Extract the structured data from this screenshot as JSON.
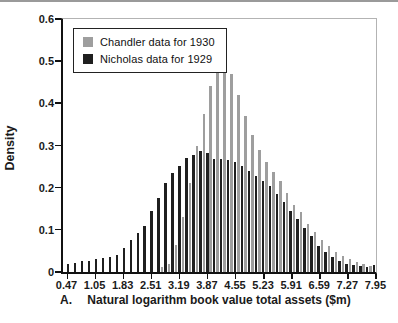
{
  "legend": {
    "items": [
      {
        "label": "Chandler data for 1930",
        "color": "#9e9e9e"
      },
      {
        "label": "Nicholas data for 1929",
        "color": "#1f1f1f"
      }
    ]
  },
  "axes": {
    "ylabel": "Density",
    "xlabel": "Natural logarithm book value total assets ($m)",
    "panel_label": "A.",
    "ytick_labels": [
      "0",
      "0.1",
      "0.2",
      "0.3",
      "0.4",
      "0.5",
      "0.6"
    ],
    "xtick_labels": [
      "0.47",
      "1.05",
      "1.83",
      "2.51",
      "3.19",
      "3.87",
      "4.55",
      "5.23",
      "5.91",
      "6.59",
      "7.27",
      "7.95"
    ]
  },
  "chart_data": {
    "type": "bar",
    "subtype": "histogram-interleaved",
    "title": "",
    "xlabel": "Natural logarithm book value total assets ($m)",
    "ylabel": "Density",
    "ylim": [
      0,
      0.6
    ],
    "xlim": [
      0.47,
      7.95
    ],
    "grid": false,
    "legend_position": "top-left",
    "x": [
      0.47,
      0.64,
      0.81,
      0.98,
      1.15,
      1.32,
      1.49,
      1.66,
      1.83,
      2.0,
      2.17,
      2.34,
      2.51,
      2.68,
      2.85,
      3.02,
      3.19,
      3.36,
      3.53,
      3.7,
      3.87,
      4.04,
      4.21,
      4.38,
      4.55,
      4.72,
      4.89,
      5.06,
      5.23,
      5.4,
      5.57,
      5.74,
      5.91,
      6.08,
      6.25,
      6.42,
      6.59,
      6.76,
      6.93,
      7.1,
      7.27,
      7.44,
      7.61,
      7.78,
      7.95
    ],
    "series": [
      {
        "name": "Chandler data for 1930",
        "color": "#9e9e9e",
        "values": [
          0,
          0,
          0,
          0,
          0,
          0,
          0,
          0,
          0,
          0,
          0,
          0,
          0,
          0,
          0.012,
          0.018,
          0.065,
          0.13,
          0.21,
          0.3,
          0.375,
          0.44,
          0.48,
          0.49,
          0.47,
          0.42,
          0.37,
          0.325,
          0.29,
          0.262,
          0.238,
          0.215,
          0.188,
          0.16,
          0.142,
          0.115,
          0.095,
          0.075,
          0.062,
          0.048,
          0.038,
          0.03,
          0.024,
          0.02,
          0.015
        ]
      },
      {
        "name": "Nicholas data for 1929",
        "color": "#1f1f1f",
        "values": [
          0.02,
          0.022,
          0.025,
          0.027,
          0.03,
          0.033,
          0.036,
          0.04,
          0.058,
          0.075,
          0.092,
          0.11,
          0.145,
          0.175,
          0.21,
          0.235,
          0.252,
          0.27,
          0.278,
          0.288,
          0.283,
          0.268,
          0.267,
          0.266,
          0.26,
          0.252,
          0.24,
          0.227,
          0.215,
          0.205,
          0.185,
          0.165,
          0.145,
          0.125,
          0.105,
          0.085,
          0.062,
          0.048,
          0.035,
          0.025,
          0.02,
          0.016,
          0.014,
          0.012,
          0.016
        ]
      }
    ]
  }
}
